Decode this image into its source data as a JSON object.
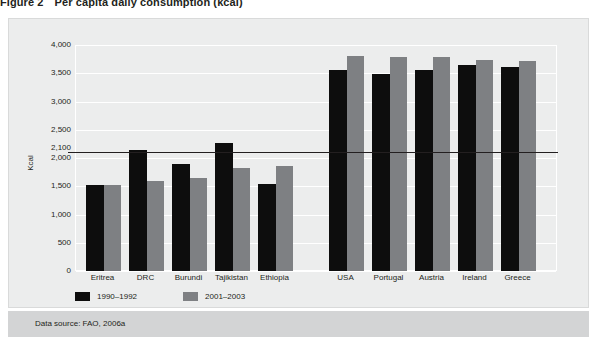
{
  "figure": {
    "number": "Figure 2",
    "title": "Per capita daily consumption (kcal)"
  },
  "source": {
    "note": "Data source: FAO, 2006a"
  },
  "chart_data": {
    "type": "bar",
    "title": "Per capita daily consumption (kcal)",
    "xlabel": "",
    "ylabel": "Kcal",
    "ylim": [
      0,
      4000
    ],
    "grid": true,
    "legend_position": "bottom-left",
    "categories": [
      "Eritrea",
      "DRC",
      "Burundi",
      "Tajikistan",
      "Ethiopia",
      "USA",
      "Portugal",
      "Austria",
      "Ireland",
      "Greece"
    ],
    "series": [
      {
        "name": "1990–1992",
        "color": "#0d0d0d",
        "values": [
          1530,
          2150,
          1890,
          2270,
          1540,
          3550,
          3480,
          3550,
          3650,
          3610
        ]
      },
      {
        "name": "2001–2003",
        "color": "#7e8083",
        "values": [
          1520,
          1590,
          1650,
          1830,
          1850,
          3810,
          3790,
          3780,
          3740,
          3720
        ]
      }
    ],
    "yticks": [
      0,
      500,
      1000,
      1500,
      2000,
      2500,
      3000,
      3500,
      4000
    ],
    "ytick_labels": [
      "0",
      "500",
      "1,000",
      "1,500",
      "2,000",
      "2,500",
      "3,000",
      "3,500",
      "4,000"
    ],
    "reference_line": {
      "value": 2100,
      "label": "2,100",
      "color": "#231f20"
    },
    "group_gap_after_index": 4
  }
}
